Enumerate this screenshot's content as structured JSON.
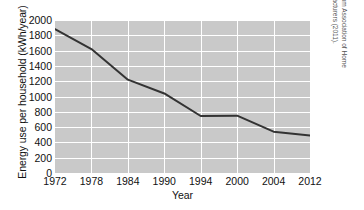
{
  "chart_data": {
    "type": "line",
    "title": "",
    "xlabel": "Year",
    "ylabel": "Energy use per household (kWh/year)",
    "categories": [
      "1972",
      "1978",
      "1984",
      "1990",
      "1994",
      "2000",
      "2004",
      "2012"
    ],
    "x": [
      1972,
      1978,
      1984,
      1990,
      1994,
      2000,
      2004,
      2012
    ],
    "values": [
      1880,
      1620,
      1220,
      1040,
      745,
      750,
      540,
      490
    ],
    "series": [
      {
        "name": "Energy use per household",
        "values": [
          1880,
          1620,
          1220,
          1040,
          745,
          750,
          540,
          490
        ],
        "color": "#333333"
      }
    ],
    "ylim": [
      0,
      2000
    ],
    "yticks": [
      0,
      200,
      400,
      600,
      800,
      1000,
      1200,
      1400,
      1600,
      1800,
      2000
    ],
    "ytick_labels": [
      "0",
      "200",
      "400",
      "600",
      "800",
      "1000",
      "1200",
      "1400",
      "1600",
      "1800",
      "2000"
    ],
    "xtick_labels": [
      "1972",
      "1978",
      "1984",
      "1990",
      "1994",
      "2000",
      "2004",
      "2012"
    ],
    "grid": true,
    "grid_color": "#ffffff",
    "plot_background": "#c9c9c9",
    "legend": "none",
    "legend_position": "none",
    "line_color": "#333333",
    "line_width": 2
  },
  "source_note": {
    "line1": "Based on data from Association of Home",
    "line2": "Appliance Manufacturers (2011).",
    "full": "Based on data from Association of Home Appliance Manufacturers (2011)."
  }
}
